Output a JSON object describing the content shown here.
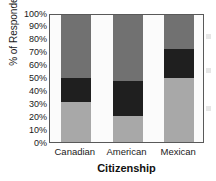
{
  "chart_data": {
    "type": "bar",
    "subtype": "stacked-100-percent",
    "title": "",
    "xlabel": "Citizenship",
    "ylabel": "% of Respondents",
    "categories": [
      "Canadian",
      "American",
      "Mexican"
    ],
    "ylim": [
      0,
      100
    ],
    "ytick_labels": [
      "0%",
      "10%",
      "20%",
      "30%",
      "40%",
      "50%",
      "60%",
      "70%",
      "80%",
      "90%",
      "100%"
    ],
    "ytick_values": [
      0,
      10,
      20,
      30,
      40,
      50,
      60,
      70,
      80,
      90,
      100
    ],
    "grid": false,
    "legend_position": "right-clipped",
    "series": [
      {
        "name": "bottom-segment",
        "color": "#a8a8a8",
        "values": [
          31,
          20,
          50
        ]
      },
      {
        "name": "middle-segment",
        "color": "#1f1f1f",
        "values": [
          19,
          27,
          22
        ]
      },
      {
        "name": "top-segment",
        "color": "#717171",
        "values": [
          50,
          53,
          28
        ]
      }
    ],
    "stack_boundaries": [
      {
        "category": "Canadian",
        "bottom_top": 31,
        "middle_top": 50,
        "top_top": 100
      },
      {
        "category": "American",
        "bottom_top": 20,
        "middle_top": 47,
        "top_top": 100
      },
      {
        "category": "Mexican",
        "bottom_top": 50,
        "middle_top": 72,
        "top_top": 100
      }
    ]
  },
  "colors": {
    "axis": "#595959",
    "text": "#1a1a1a",
    "plot_background": "#fbfbfb",
    "page_background": "#ffffff"
  }
}
